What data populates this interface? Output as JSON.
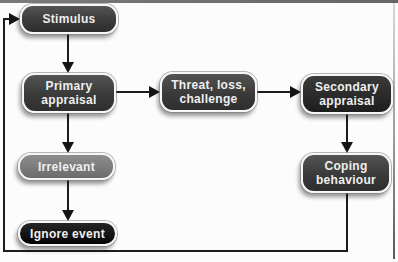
{
  "diagram": {
    "nodes": {
      "stimulus": {
        "label": "Stimulus"
      },
      "primary_appraisal": {
        "label": "Primary\nappraisal"
      },
      "threat_loss_challenge": {
        "label": "Threat, loss,\nchallenge"
      },
      "secondary_appraisal": {
        "label": "Secondary\nappraisal"
      },
      "irrelevant": {
        "label": "Irrelevant"
      },
      "coping_behaviour": {
        "label": "Coping\nbehaviour"
      },
      "ignore_event": {
        "label": "Ignore event"
      }
    },
    "edges": [
      {
        "from": "stimulus",
        "to": "primary_appraisal",
        "type": "arrow"
      },
      {
        "from": "primary_appraisal",
        "to": "threat_loss_challenge",
        "type": "arrow"
      },
      {
        "from": "threat_loss_challenge",
        "to": "secondary_appraisal",
        "type": "arrow"
      },
      {
        "from": "secondary_appraisal",
        "to": "coping_behaviour",
        "type": "arrow"
      },
      {
        "from": "primary_appraisal",
        "to": "irrelevant",
        "type": "arrow"
      },
      {
        "from": "irrelevant",
        "to": "ignore_event",
        "type": "arrow"
      },
      {
        "from": "coping_behaviour",
        "to": "stimulus",
        "type": "feedback-loop"
      }
    ],
    "colors": {
      "node_dark": "#3a3a3a",
      "node_darker": "#242424",
      "node_black": "#0a0a0a",
      "node_gray": "#787878",
      "node_border": "#f6f6f6",
      "node_text": "#efefef",
      "connector": "#1c1c1c",
      "frame_border": "#6f6f6f",
      "background": "#fcfcfc"
    }
  }
}
